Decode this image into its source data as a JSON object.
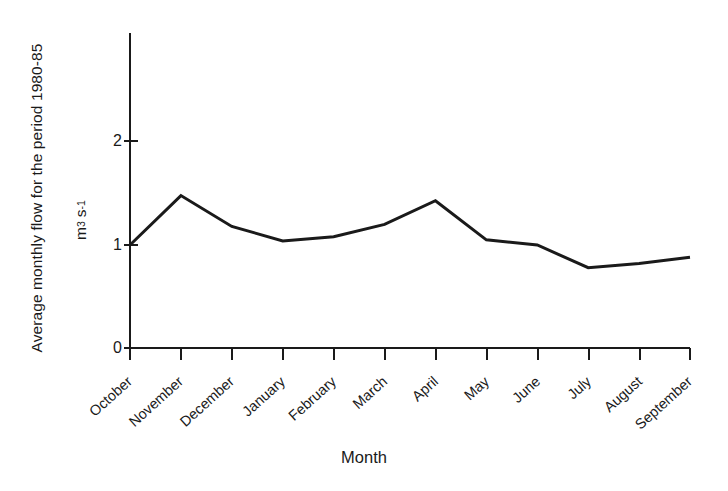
{
  "chart_data": {
    "type": "line",
    "title": "",
    "subtitle": "",
    "xlabel": "Month",
    "ylabel": "Average monthly flow for the period 1980-85",
    "yunit": "m3 s-1",
    "yunit_parts": {
      "base1": "m",
      "sup1": "3",
      "base2": "s",
      "sup2": "-1"
    },
    "categories": [
      "October",
      "November",
      "December",
      "January",
      "February",
      "March",
      "April",
      "May",
      "June",
      "July",
      "August",
      "September"
    ],
    "values": [
      1.0,
      1.48,
      1.18,
      1.04,
      1.08,
      1.2,
      1.43,
      1.05,
      1.0,
      0.78,
      0.82,
      0.88
    ],
    "series": [
      {
        "name": "Average monthly flow",
        "values": [
          1.0,
          1.48,
          1.18,
          1.04,
          1.08,
          1.2,
          1.43,
          1.05,
          1.0,
          0.78,
          0.82,
          0.88
        ]
      }
    ],
    "ylim": [
      0,
      2.55
    ],
    "yticks": [
      0,
      1,
      2
    ],
    "ytick_labels": [
      "0",
      "1",
      "2"
    ],
    "xlim": [
      0,
      11
    ],
    "grid": false,
    "legend": false,
    "legend_position": "none",
    "line_color": "#1a1a1a",
    "line_width": 3,
    "axis_color": "#1a1a1a",
    "background_color": "#ffffff"
  },
  "axes": {
    "y_tick_0": "0",
    "y_tick_1": "1",
    "y_tick_2": "2"
  },
  "x_labels": {
    "m0": "October",
    "m1": "November",
    "m2": "December",
    "m3": "January",
    "m4": "February",
    "m5": "March",
    "m6": "April",
    "m7": "May",
    "m8": "June",
    "m9": "July",
    "m10": "August",
    "m11": "September"
  }
}
